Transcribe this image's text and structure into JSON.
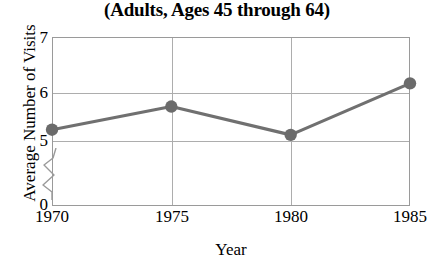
{
  "chart_data": {
    "type": "line",
    "title": "(Adults, Ages 45 through 64)",
    "xlabel": "Year",
    "ylabel": "Average Number of Visits",
    "x": [
      1970,
      1975,
      1980,
      1985
    ],
    "categories": [
      "1970",
      "1975",
      "1980",
      "1985"
    ],
    "values": [
      5.2,
      5.65,
      5.1,
      6.1
    ],
    "series": [
      {
        "name": "Average Number of Visits",
        "values": [
          5.2,
          5.65,
          5.1,
          6.1
        ]
      }
    ],
    "xlim": [
      1970,
      1985
    ],
    "ylim": [
      5.0,
      7.0
    ],
    "yticks": [
      "7",
      "6",
      "5",
      "0"
    ],
    "ytick_values": [
      7,
      6,
      5,
      0
    ],
    "xticks": [
      "1970",
      "1975",
      "1980",
      "1985"
    ],
    "grid": true,
    "legend": "none",
    "axis_break": true,
    "axis_break_note": "y-axis broken between 0 and 5",
    "marker": "filled-circle",
    "colors": {
      "line": "#707070",
      "marker": "#6b6b6b",
      "grid": "#adadad",
      "frame": "#9a9a9a",
      "text": "#000000",
      "background": "#ffffff"
    }
  },
  "ticks": {
    "y": [
      {
        "label": "7"
      },
      {
        "label": "6"
      },
      {
        "label": "5"
      },
      {
        "label": "0"
      }
    ],
    "x": [
      {
        "label": "1970"
      },
      {
        "label": "1975"
      },
      {
        "label": "1980"
      },
      {
        "label": "1985"
      }
    ]
  }
}
